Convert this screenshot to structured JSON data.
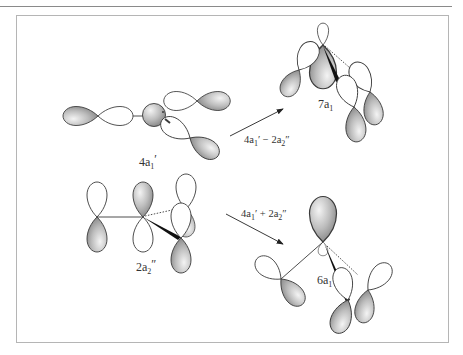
{
  "figure": {
    "structures": [
      {
        "id": "4a1prime",
        "label_main": "4a",
        "label_sub": "1",
        "label_prime": "′"
      },
      {
        "id": "2a2dprime",
        "label_main": "2a",
        "label_sub": "2",
        "label_prime": "″"
      },
      {
        "id": "7a1",
        "label_main": "7a",
        "label_sub": "1",
        "label_prime": ""
      },
      {
        "id": "6a1",
        "label_main": "6a",
        "label_sub": "1",
        "label_prime": ""
      }
    ],
    "arrows": [
      {
        "id": "minus",
        "t1": "4a",
        "s1": "1",
        "p1": "′",
        "op": " − 2a",
        "s2": "2",
        "p2": "″"
      },
      {
        "id": "plus",
        "t1": "4a",
        "s1": "1",
        "p1": "′",
        "op": " + 2a",
        "s2": "2",
        "p2": "″"
      }
    ],
    "colors": {
      "lobe_shaded_light": "#f2f2f2",
      "lobe_shaded_dark": "#8c8c8c",
      "outline": "#3a3a3a",
      "frame": "#b5b5b5"
    }
  }
}
